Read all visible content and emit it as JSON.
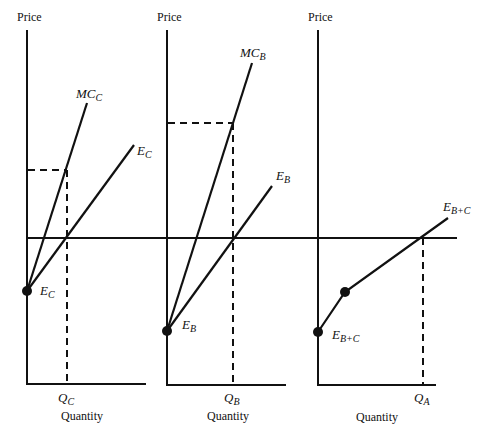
{
  "diagram": {
    "line_color": "#111111",
    "background": "#ffffff",
    "panels": [
      {
        "id": "C",
        "y_axis_label": "Price",
        "x_axis_label": "Quantity",
        "curves": [
          {
            "name": "MC",
            "sub": "C"
          },
          {
            "name": "E",
            "sub": "C"
          }
        ],
        "point_label": {
          "name": "E",
          "sub": "C"
        },
        "q_label": {
          "name": "Q",
          "sub": "C"
        }
      },
      {
        "id": "B",
        "y_axis_label": "Price",
        "x_axis_label": "Quantity",
        "curves": [
          {
            "name": "MC",
            "sub": "B"
          },
          {
            "name": "E",
            "sub": "B"
          }
        ],
        "point_label": {
          "name": "E",
          "sub": "B"
        },
        "q_label": {
          "name": "Q",
          "sub": "B"
        }
      },
      {
        "id": "A",
        "y_axis_label": "Price",
        "x_axis_label": "Quantity",
        "curves": [
          {
            "name": "E",
            "sub": "B+C"
          }
        ],
        "point_label": {
          "name": "E",
          "sub": "B+C"
        },
        "q_label": {
          "name": "Q",
          "sub": "A"
        }
      }
    ]
  }
}
